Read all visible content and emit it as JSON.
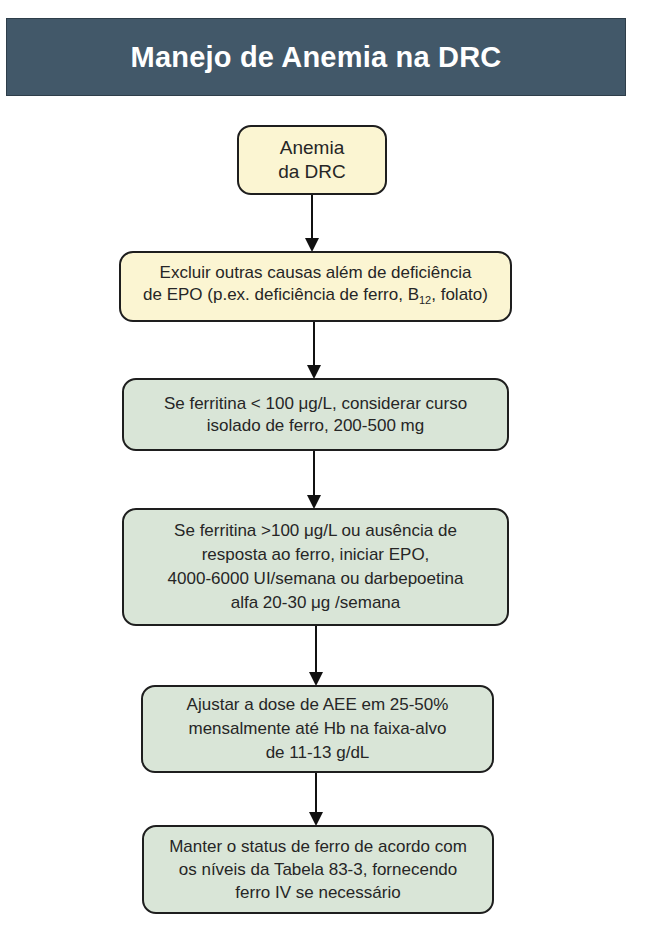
{
  "header": {
    "title": "Manejo de Anemia na DRC",
    "background_color": "#425869"
  },
  "colors": {
    "start_box": "#fbf5d2",
    "step_box": "#d9e5d7",
    "border": "#1e1e1e"
  },
  "flowchart": {
    "nodes": [
      {
        "id": "start",
        "text": "Anemia\nda DRC"
      },
      {
        "id": "exclude",
        "text_line1": "Excluir outras causas além de deficiência",
        "text_line2_pre": "de EPO (p.ex. deficiência de ferro, B",
        "text_line2_sub": "12",
        "text_line2_post": ", folato)"
      },
      {
        "id": "iron",
        "text": "Se ferritina < 100 μg/L, considerar curso\nisolado de ferro, 200-500 mg"
      },
      {
        "id": "epo",
        "text": "Se ferritina >100 μg/L ou ausência de\nresposta ao ferro, iniciar EPO,\n4000-6000 UI/semana ou darbepoetina\nalfa 20-30 μg /semana"
      },
      {
        "id": "adjust",
        "text": "Ajustar a dose de AEE em 25-50%\nmensalmente até Hb na faixa-alvo\nde 11-13 g/dL"
      },
      {
        "id": "maintain",
        "text": "Manter o status de ferro de acordo com\nos níveis da Tabela 83-3, fornecendo\nferro IV se necessário"
      }
    ],
    "edges": [
      [
        "start",
        "exclude"
      ],
      [
        "exclude",
        "iron"
      ],
      [
        "iron",
        "epo"
      ],
      [
        "epo",
        "adjust"
      ],
      [
        "adjust",
        "maintain"
      ]
    ]
  }
}
